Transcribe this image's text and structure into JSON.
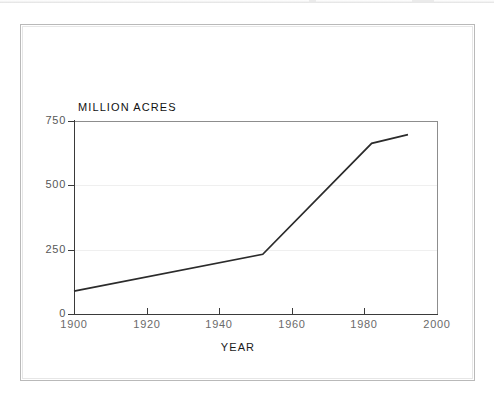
{
  "figure": {
    "background_color": "#ffffff",
    "frame_color": "#b9b9b9",
    "line_color": "#2b2b2b",
    "gridline_color": "#efefef"
  },
  "chart_data": {
    "type": "line",
    "title": "",
    "subtitle": "",
    "xlabel": "YEAR",
    "ylabel": "MILLION ACRES",
    "xlim": [
      1900,
      2000
    ],
    "ylim": [
      0,
      750
    ],
    "xticks": [
      1900,
      1920,
      1940,
      1960,
      1980,
      2000
    ],
    "xtick_labels": [
      "1900",
      "1920",
      "1940",
      "1960",
      "1980",
      "2000"
    ],
    "yticks": [
      0,
      250,
      500,
      750
    ],
    "ytick_labels": [
      "0",
      "250",
      "500",
      "750"
    ],
    "grid": "horizontal-faint",
    "legend": "none",
    "series": [
      {
        "name": "Million acres",
        "color": "#2b2b2b",
        "x": [
          1900,
          1952,
          1982,
          1992
        ],
        "values": [
          89,
          232,
          663,
          697
        ]
      }
    ]
  }
}
